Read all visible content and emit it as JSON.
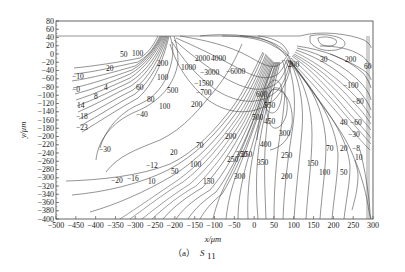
{
  "chart_data": {
    "type": "contour",
    "title": "",
    "caption": "(a) S11",
    "caption_parts": {
      "prefix": "（a）",
      "symbol": "S",
      "subscript": "11"
    },
    "xlabel": "x/μm",
    "ylabel": "y/μm",
    "xlim": [
      -500,
      300
    ],
    "ylim": [
      -400,
      80
    ],
    "x_ticks": [
      -500,
      -450,
      -400,
      -350,
      -300,
      -250,
      -200,
      -150,
      -100,
      -50,
      0,
      50,
      100,
      150,
      200,
      250,
      300
    ],
    "y_ticks": [
      80,
      60,
      40,
      20,
      0,
      -20,
      -40,
      -60,
      -80,
      -100,
      -120,
      -140,
      -160,
      -180,
      -200,
      -220,
      -240,
      -260,
      -280,
      -300,
      -320,
      -340,
      -360,
      -380,
      -400
    ],
    "grid": false,
    "legend": null,
    "contour_labels": [
      {
        "value": "50",
        "x": -310,
        "y": -10
      },
      {
        "value": "100",
        "x": -270,
        "y": -10
      },
      {
        "value": "20",
        "x": -360,
        "y": -38
      },
      {
        "value": "-10",
        "x": -430,
        "y": -55
      },
      {
        "value": "0",
        "x": -440,
        "y": -80
      },
      {
        "value": "4",
        "x": -370,
        "y": -78
      },
      {
        "value": "8",
        "x": -405,
        "y": -92
      },
      {
        "value": "14",
        "x": -430,
        "y": -115
      },
      {
        "value": "-18",
        "x": -430,
        "y": -135
      },
      {
        "value": "-23",
        "x": -425,
        "y": -158
      },
      {
        "value": "200",
        "x": -195,
        "y": -20
      },
      {
        "value": "1000",
        "x": -140,
        "y": -25
      },
      {
        "value": "2000",
        "x": -80,
        "y": -8
      },
      {
        "value": "4000",
        "x": -45,
        "y": -8
      },
      {
        "value": "3000",
        "x": -60,
        "y": -32
      },
      {
        "value": "6000",
        "x": 0,
        "y": -30
      },
      {
        "value": "-1500",
        "x": -110,
        "y": -55
      },
      {
        "value": "-700",
        "x": -100,
        "y": -80
      },
      {
        "value": "100",
        "x": -190,
        "y": -52
      },
      {
        "value": "500",
        "x": -150,
        "y": -75
      },
      {
        "value": "60",
        "x": -240,
        "y": -75
      },
      {
        "value": "80",
        "x": -215,
        "y": -102
      },
      {
        "value": "100",
        "x": -180,
        "y": -110
      },
      {
        "value": "200",
        "x": -130,
        "y": -110
      },
      {
        "value": "-40",
        "x": -250,
        "y": -130
      },
      {
        "value": "-30",
        "x": -340,
        "y": -210
      },
      {
        "value": "20",
        "x": -190,
        "y": -215
      },
      {
        "value": "70",
        "x": -130,
        "y": -205
      },
      {
        "value": "-12",
        "x": -230,
        "y": -258
      },
      {
        "value": "-20",
        "x": -290,
        "y": -295
      },
      {
        "value": "-16",
        "x": -265,
        "y": -293
      },
      {
        "value": "10",
        "x": -230,
        "y": -305
      },
      {
        "value": "50",
        "x": -185,
        "y": -278
      },
      {
        "value": "100",
        "x": -150,
        "y": -265
      },
      {
        "value": "150",
        "x": -115,
        "y": -300
      },
      {
        "value": "200",
        "x": -80,
        "y": -180
      },
      {
        "value": "250",
        "x": -80,
        "y": -245
      },
      {
        "value": "600",
        "x": 20,
        "y": -105
      },
      {
        "value": "550",
        "x": 40,
        "y": -135
      },
      {
        "value": "500",
        "x": 20,
        "y": -165
      },
      {
        "value": "450",
        "x": 40,
        "y": -175
      },
      {
        "value": "400",
        "x": 30,
        "y": -230
      },
      {
        "value": "350",
        "x": 0,
        "y": -250
      },
      {
        "value": "350",
        "x": 40,
        "y": -262
      },
      {
        "value": "300",
        "x": -20,
        "y": -295
      },
      {
        "value": "250",
        "x": 5,
        "y": -255
      },
      {
        "value": "300",
        "x": 90,
        "y": -190
      },
      {
        "value": "250",
        "x": 90,
        "y": -255
      },
      {
        "value": "200",
        "x": 90,
        "y": -290
      },
      {
        "value": "150",
        "x": 150,
        "y": -268
      },
      {
        "value": "100",
        "x": 190,
        "y": -285
      },
      {
        "value": "70",
        "x": 190,
        "y": -240
      },
      {
        "value": "50",
        "x": 225,
        "y": -285
      },
      {
        "value": "20",
        "x": 235,
        "y": -240
      },
      {
        "value": "-8",
        "x": 260,
        "y": -240
      },
      {
        "value": "10",
        "x": 265,
        "y": -260
      },
      {
        "value": "-30",
        "x": 250,
        "y": -200
      },
      {
        "value": "40",
        "x": 240,
        "y": -168
      },
      {
        "value": "-60",
        "x": 265,
        "y": -168
      },
      {
        "value": "-80",
        "x": 270,
        "y": -130
      },
      {
        "value": "-100",
        "x": 255,
        "y": -95
      },
      {
        "value": "200",
        "x": 155,
        "y": -30
      },
      {
        "value": "30",
        "x": 200,
        "y": -5
      },
      {
        "value": "200",
        "x": 265,
        "y": -8
      },
      {
        "value": "-60",
        "x": 290,
        "y": -25
      }
    ]
  }
}
